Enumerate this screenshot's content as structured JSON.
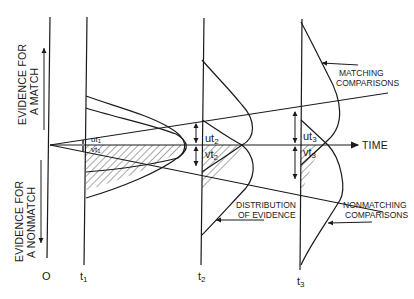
{
  "diagram": {
    "axis_labels": {
      "match_line1": "EVIDENCE FOR",
      "match_line2": "A MATCH",
      "nonmatch_line1": "EVIDENCE FOR",
      "nonmatch_line2": "A NONMATCH",
      "time": "TIME",
      "origin": "O"
    },
    "time_points": [
      {
        "label": "t",
        "sub": "1"
      },
      {
        "label": "t",
        "sub": "2"
      },
      {
        "label": "t",
        "sub": "3"
      }
    ],
    "measures": [
      {
        "u": "ut",
        "u_sub": "1",
        "v": "vt",
        "v_sub": "1"
      },
      {
        "u": "ut",
        "u_sub": "2",
        "v": "vt",
        "v_sub": "2"
      },
      {
        "u": "ut",
        "u_sub": "3",
        "v": "vt",
        "v_sub": "3"
      }
    ],
    "annotations": {
      "matching_line1": "MATCHING",
      "matching_line2": "COMPARISONS",
      "distribution_line1": "DISTRIBUTION",
      "distribution_line2": "OF EVIDENCE",
      "nonmatching_line1": "NONMATCHING",
      "nonmatching_line2": "COMPARISONS"
    },
    "colors": {
      "ink": "#1a1a1a",
      "background": "#ffffff"
    }
  }
}
